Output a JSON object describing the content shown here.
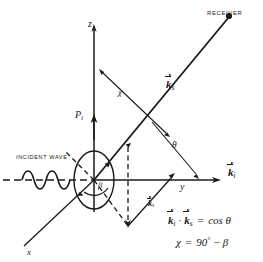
{
  "figure": {
    "background_color": "#ffffff",
    "line_color": "#1a1a1a",
    "width": 263,
    "height": 262
  },
  "axes": [
    {
      "name": "z-axis",
      "label": "z",
      "orientation": "vertical-up"
    },
    {
      "name": "y-axis",
      "label": "y",
      "orientation": "horizontal-right"
    },
    {
      "name": "x-axis",
      "label": "x",
      "orientation": "diagonal-lower-left"
    }
  ],
  "labels": {
    "receiver": "RECEIVER",
    "incident_wave": "INCIDENT WAVE",
    "z_axis": "z",
    "y_axis": "y",
    "x_axis": "x",
    "polarization": "P",
    "polarization_sub": "i",
    "chi": "χ",
    "theta": "θ",
    "beta": "β",
    "k_scattered_symbol": "k",
    "k_scattered_sub": "s",
    "k_incident_symbol": "k",
    "k_incident_sub": "i",
    "projection_vector_symbol": "k",
    "projection_vector_sub": "s"
  },
  "equations": {
    "dot_product": {
      "lhs_vec1": "k",
      "lhs_vec1_sub": "i",
      "operator_dot": "·",
      "lhs_vec2": "k",
      "lhs_vec2_sub": "s",
      "equals": "=",
      "rhs": "cos θ"
    },
    "chi_relation": {
      "lhs": "χ",
      "equals": "=",
      "rhs_value": "90",
      "rhs_degree": "°",
      "rhs_minus": "−",
      "rhs_term": "β"
    }
  },
  "annotations": {
    "angle_chi_description": "angle between z-axis and scattered direction",
    "angle_theta_description": "angle between scattered wave vector and y-axis",
    "angle_beta_description": "angle at origin in the scattering plane"
  }
}
